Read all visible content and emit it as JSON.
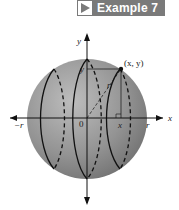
{
  "banner": {
    "icon": "play-triangle-icon",
    "label": "Example 7",
    "background": "#7a7a7a"
  },
  "figure": {
    "axis_labels": {
      "x": "x",
      "y": "y",
      "origin": "0",
      "neg_r": "−r",
      "pos_r": "r",
      "point_x": "x",
      "point_y": "y",
      "radius": "r",
      "point": "(x, y)"
    },
    "sphere_color": "#8c8c8c"
  }
}
